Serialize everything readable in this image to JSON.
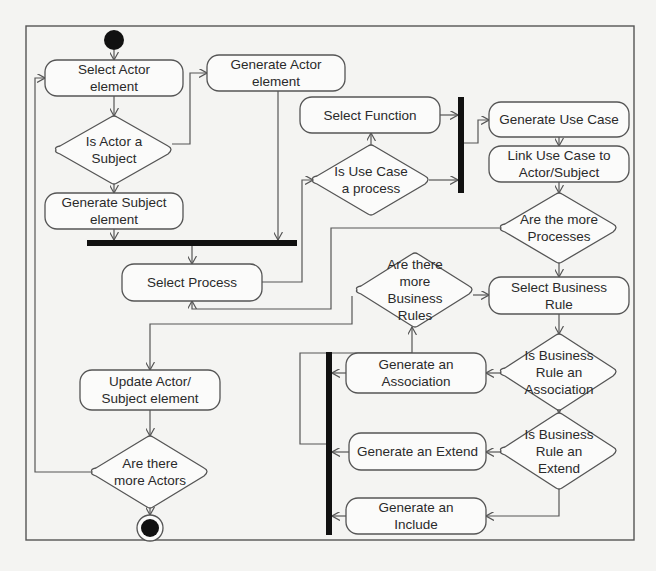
{
  "diagram": {
    "type": "activity",
    "frame": {
      "x": 26,
      "y": 26,
      "w": 608,
      "h": 514
    },
    "colors": {
      "stroke": "#555555",
      "fill": "#fbfbfa",
      "bar": "#111111",
      "text": "#2a2a2a",
      "background": "#f4f4f2"
    },
    "start_node": {
      "id": "start",
      "cx": 114,
      "cy": 40,
      "r": 10
    },
    "end_node": {
      "id": "end",
      "cx": 150,
      "cy": 528,
      "r": 9,
      "ring": 13
    },
    "actions": [
      {
        "id": "select-actor-element",
        "lines": [
          "Select Actor",
          "element"
        ],
        "x": 45,
        "y": 60,
        "w": 138,
        "h": 36
      },
      {
        "id": "generate-actor-element",
        "lines": [
          "Generate Actor",
          "element"
        ],
        "x": 207,
        "y": 55,
        "w": 138,
        "h": 36
      },
      {
        "id": "generate-subject-element",
        "lines": [
          "Generate Subject",
          "element"
        ],
        "x": 45,
        "y": 193,
        "w": 138,
        "h": 36
      },
      {
        "id": "select-function",
        "lines": [
          "Select Function"
        ],
        "x": 300,
        "y": 97,
        "w": 140,
        "h": 36
      },
      {
        "id": "generate-use-case",
        "lines": [
          "Generate Use Case"
        ],
        "x": 489,
        "y": 102,
        "w": 140,
        "h": 35
      },
      {
        "id": "link-use-case",
        "lines": [
          "Link Use Case to",
          "Actor/Subject"
        ],
        "x": 489,
        "y": 146,
        "w": 140,
        "h": 36
      },
      {
        "id": "select-process",
        "lines": [
          "Select Process"
        ],
        "x": 122,
        "y": 264,
        "w": 140,
        "h": 37
      },
      {
        "id": "select-business-rule",
        "lines": [
          "Select Business",
          "Rule"
        ],
        "x": 489,
        "y": 277,
        "w": 140,
        "h": 37
      },
      {
        "id": "update-actor-subject",
        "lines": [
          "Update Actor/",
          "Subject element"
        ],
        "x": 80,
        "y": 370,
        "w": 140,
        "h": 40
      },
      {
        "id": "generate-association",
        "lines": [
          "Generate an",
          "Association"
        ],
        "x": 346,
        "y": 353,
        "w": 140,
        "h": 40
      },
      {
        "id": "generate-extend",
        "lines": [
          "Generate an Extend"
        ],
        "x": 349,
        "y": 433,
        "w": 137,
        "h": 37
      },
      {
        "id": "generate-include",
        "lines": [
          "Generate an",
          "Include"
        ],
        "x": 346,
        "y": 498,
        "w": 140,
        "h": 36
      }
    ],
    "decisions": [
      {
        "id": "is-actor-a-subject",
        "lines": [
          "Is Actor a",
          "Subject"
        ],
        "cx": 114,
        "cy": 150,
        "hw": 58,
        "hh": 34
      },
      {
        "id": "is-use-case-a-process",
        "lines": [
          "Is Use Case",
          "a process"
        ],
        "cx": 371,
        "cy": 180,
        "hw": 58,
        "hh": 35
      },
      {
        "id": "are-the-more-processes",
        "lines": [
          "Are the more",
          "Processes"
        ],
        "cx": 559,
        "cy": 228,
        "hw": 58,
        "hh": 35
      },
      {
        "id": "are-there-more-business-rules",
        "lines": [
          "Are there",
          "more",
          "Business",
          "Rules"
        ],
        "cx": 415,
        "cy": 290,
        "hw": 58,
        "hh": 37
      },
      {
        "id": "is-business-rule-an-association",
        "lines": [
          "Is Business",
          "Rule an",
          "Association"
        ],
        "cx": 559,
        "cy": 372,
        "hw": 58,
        "hh": 38
      },
      {
        "id": "is-business-rule-an-extend",
        "lines": [
          "Is Business",
          "Rule an",
          "Extend"
        ],
        "cx": 559,
        "cy": 451,
        "hw": 58,
        "hh": 38
      },
      {
        "id": "are-there-more-actors",
        "lines": [
          "Are there",
          "more Actors"
        ],
        "cx": 150,
        "cy": 472,
        "hw": 58,
        "hh": 36
      }
    ],
    "bars": [
      {
        "id": "sync-bar-actor-join",
        "x": 87,
        "y": 240,
        "w": 210,
        "h": 6
      },
      {
        "id": "sync-bar-function-fork",
        "x": 458,
        "y": 97,
        "w": 6,
        "h": 96
      },
      {
        "id": "sync-bar-rule-join",
        "x": 326,
        "y": 352,
        "w": 6,
        "h": 183
      }
    ],
    "edges": [
      {
        "id": "start-to-select-actor",
        "points": [
          [
            114,
            50
          ],
          [
            114,
            60
          ]
        ],
        "arrow": true
      },
      {
        "id": "select-actor-to-decision",
        "points": [
          [
            114,
            96
          ],
          [
            114,
            116
          ]
        ],
        "arrow": true
      },
      {
        "id": "decision-yes-to-generate-subject",
        "points": [
          [
            114,
            184
          ],
          [
            114,
            193
          ]
        ],
        "arrow": true
      },
      {
        "id": "decision-no-to-generate-actor",
        "points": [
          [
            172,
            144
          ],
          [
            190,
            144
          ],
          [
            190,
            73
          ],
          [
            207,
            73
          ]
        ],
        "arrow": true
      },
      {
        "id": "generate-subject-to-bar",
        "points": [
          [
            114,
            229
          ],
          [
            114,
            240
          ]
        ],
        "arrow": true
      },
      {
        "id": "generate-actor-to-bar",
        "points": [
          [
            278,
            91
          ],
          [
            278,
            240
          ]
        ],
        "arrow": true
      },
      {
        "id": "bar-to-select-process",
        "points": [
          [
            192,
            246
          ],
          [
            192,
            264
          ]
        ],
        "arrow": true
      },
      {
        "id": "select-process-to-use-case-decision",
        "points": [
          [
            262,
            282
          ],
          [
            302,
            282
          ],
          [
            302,
            180
          ],
          [
            313,
            180
          ]
        ],
        "arrow": true
      },
      {
        "id": "use-case-decision-to-select-function",
        "points": [
          [
            371,
            145
          ],
          [
            371,
            133
          ]
        ],
        "arrow": true
      },
      {
        "id": "select-function-to-fork",
        "points": [
          [
            440,
            115
          ],
          [
            458,
            115
          ]
        ],
        "arrow": true
      },
      {
        "id": "use-case-decision-to-fork",
        "points": [
          [
            429,
            180
          ],
          [
            458,
            180
          ]
        ],
        "arrow": true
      },
      {
        "id": "fork-to-generate-use-case",
        "points": [
          [
            464,
            143
          ],
          [
            478,
            143
          ],
          [
            478,
            120
          ],
          [
            489,
            120
          ]
        ],
        "arrow": true
      },
      {
        "id": "generate-use-case-to-link",
        "points": [
          [
            559,
            137
          ],
          [
            559,
            146
          ]
        ],
        "arrow": true
      },
      {
        "id": "link-to-more-processes",
        "points": [
          [
            559,
            182
          ],
          [
            559,
            193
          ]
        ],
        "arrow": true
      },
      {
        "id": "more-processes-yes-to-select-process",
        "points": [
          [
            501,
            228
          ],
          [
            331,
            228
          ],
          [
            331,
            309
          ],
          [
            192,
            309
          ],
          [
            192,
            301
          ]
        ],
        "arrow": true
      },
      {
        "id": "more-processes-no-to-select-rule",
        "points": [
          [
            559,
            263
          ],
          [
            559,
            277
          ]
        ],
        "arrow": true
      },
      {
        "id": "more-rules-to-select-rule",
        "points": [
          [
            473,
            295
          ],
          [
            489,
            295
          ]
        ],
        "arrow": true
      },
      {
        "id": "more-rules-no-to-update-actor",
        "points": [
          [
            352,
            296
          ],
          [
            352,
            324
          ],
          [
            150,
            324
          ],
          [
            150,
            370
          ]
        ],
        "arrow": true
      },
      {
        "id": "select-rule-to-association-decision",
        "points": [
          [
            559,
            314
          ],
          [
            559,
            334
          ]
        ],
        "arrow": true
      },
      {
        "id": "association-decision-yes",
        "points": [
          [
            501,
            373
          ],
          [
            486,
            373
          ]
        ],
        "arrow": true
      },
      {
        "id": "association-decision-no",
        "points": [
          [
            559,
            410
          ],
          [
            559,
            413
          ]
        ],
        "arrow": true
      },
      {
        "id": "extend-decision-yes",
        "points": [
          [
            501,
            452
          ],
          [
            486,
            452
          ]
        ],
        "arrow": true
      },
      {
        "id": "extend-decision-no",
        "points": [
          [
            559,
            489
          ],
          [
            559,
            516
          ],
          [
            486,
            516
          ]
        ],
        "arrow": true
      },
      {
        "id": "association-to-join",
        "points": [
          [
            346,
            373
          ],
          [
            332,
            373
          ]
        ],
        "arrow": true
      },
      {
        "id": "extend-to-join",
        "points": [
          [
            349,
            452
          ],
          [
            332,
            452
          ]
        ],
        "arrow": true
      },
      {
        "id": "include-to-join",
        "points": [
          [
            346,
            516
          ],
          [
            332,
            516
          ]
        ],
        "arrow": true
      },
      {
        "id": "join-to-more-rules",
        "points": [
          [
            326,
            444
          ],
          [
            300,
            444
          ],
          [
            300,
            353
          ],
          [
            412,
            353
          ],
          [
            412,
            327
          ]
        ],
        "arrow": true
      },
      {
        "id": "update-actor-to-more-actors",
        "points": [
          [
            150,
            410
          ],
          [
            150,
            436
          ]
        ],
        "arrow": true
      },
      {
        "id": "more-actors-yes-to-select-actor",
        "points": [
          [
            92,
            472
          ],
          [
            35,
            472
          ],
          [
            35,
            78
          ],
          [
            45,
            78
          ]
        ],
        "arrow": true
      },
      {
        "id": "more-actors-no-to-end",
        "points": [
          [
            150,
            508
          ],
          [
            150,
            515
          ]
        ],
        "arrow": true
      }
    ]
  }
}
